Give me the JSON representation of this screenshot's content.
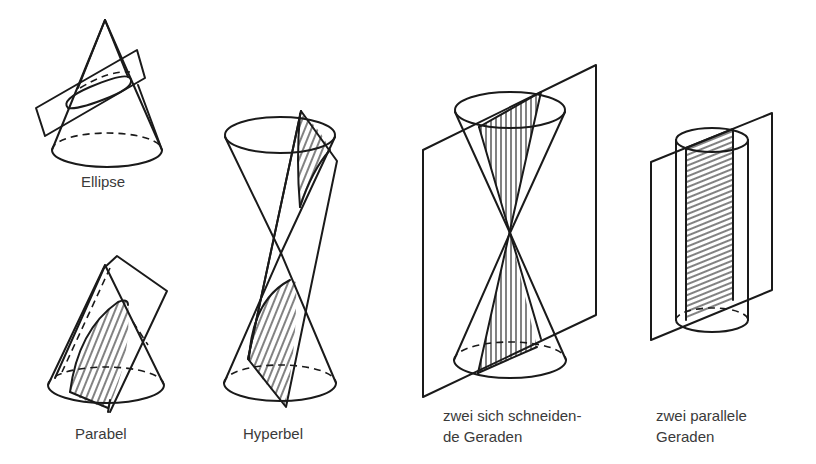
{
  "figure": {
    "colors": {
      "stroke": "#1a1a1a",
      "text": "#3a3a3a",
      "background": "#ffffff"
    },
    "panels": [
      {
        "id": "ellipse",
        "label_lines": [
          "Ellipse"
        ],
        "shape": "cone",
        "section": "ellipse"
      },
      {
        "id": "parabel",
        "label_lines": [
          "Parabel"
        ],
        "shape": "cone",
        "section": "parabola"
      },
      {
        "id": "hyperbel",
        "label_lines": [
          "Hyperbel"
        ],
        "shape": "double-cone",
        "section": "hyperbola"
      },
      {
        "id": "schneidende-geraden",
        "label_lines": [
          "zwei sich schneiden-",
          "de Geraden"
        ],
        "shape": "double-cone",
        "section": "two intersecting lines"
      },
      {
        "id": "parallele-geraden",
        "label_lines": [
          "zwei parallele",
          "Geraden"
        ],
        "shape": "cylinder",
        "section": "two parallel lines"
      }
    ]
  }
}
